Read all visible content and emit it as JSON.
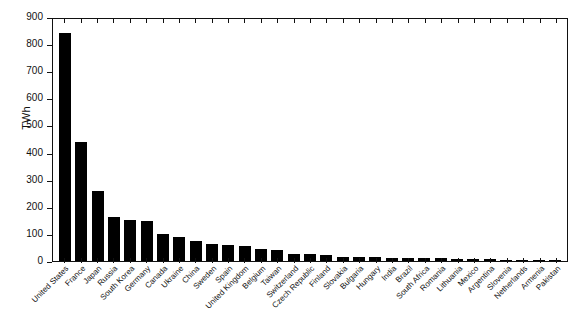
{
  "chart_data": {
    "type": "bar",
    "title": "",
    "xlabel": "",
    "ylabel": "TWh",
    "ylim": [
      0,
      900
    ],
    "yticks": [
      0,
      100,
      200,
      300,
      400,
      500,
      600,
      700,
      800,
      900
    ],
    "grid": false,
    "legend": null,
    "bar_color": "#000000",
    "background_color": "#ffffff",
    "categories": [
      "United States",
      "France",
      "Japan",
      "Russia",
      "South Korea",
      "Germany",
      "Canada",
      "Ukraine",
      "China",
      "Sweden",
      "Spain",
      "United Kingdom",
      "Belgium",
      "Taiwan",
      "Switzerland",
      "Czech Republic",
      "Finland",
      "Slovakia",
      "Bulgaria",
      "Hungary",
      "India",
      "Brazil",
      "South Africa",
      "Romania",
      "Lithuania",
      "Mexico",
      "Argentina",
      "Slovenia",
      "Netherlands",
      "Armenia",
      "Pakistan"
    ],
    "values": [
      840,
      440,
      258,
      164,
      150,
      149,
      101,
      88,
      74,
      64,
      59,
      56,
      46,
      42,
      26,
      25,
      22,
      15,
      15,
      14,
      12,
      12,
      11,
      10,
      9,
      9,
      7,
      5,
      4,
      2.5,
      2
    ]
  }
}
